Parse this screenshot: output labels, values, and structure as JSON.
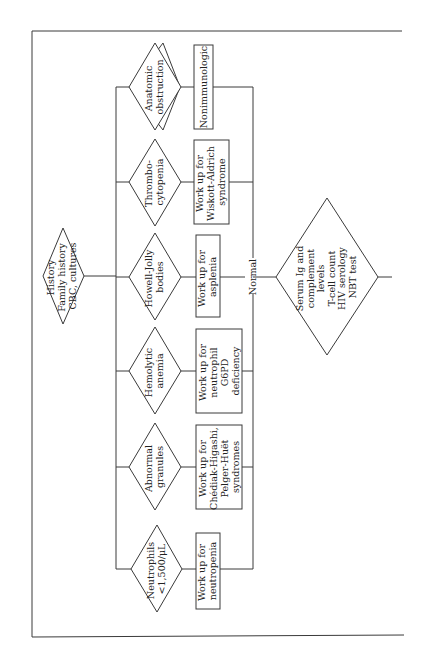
{
  "diagram": {
    "orientation": "rotated-90-ccw",
    "colors": {
      "line": "#3a3a3a",
      "text": "#222222",
      "background": "#ffffff"
    },
    "start_node": {
      "lines": [
        "History",
        "Family history",
        "CBC, cultures"
      ]
    },
    "branches": [
      {
        "condition": [
          "Anatomic",
          "obstruction"
        ],
        "action": [
          "Nonimmunologic"
        ]
      },
      {
        "condition": [
          "Thrombo-",
          "cytopenia"
        ],
        "action": [
          "Work up for",
          "Wiskott-Aldrich",
          "syndrome"
        ]
      },
      {
        "condition": [
          "Howell-Jolly",
          "bodies"
        ],
        "action": [
          "Work up for",
          "asplenia"
        ]
      },
      {
        "condition": [
          "Hemolytic",
          "anemia"
        ],
        "action": [
          "Work up for",
          "neutrophil",
          "G6PD",
          "deficiency"
        ]
      },
      {
        "condition": [
          "Abnormal",
          "granules"
        ],
        "action": [
          "Work up for",
          "Chédiak-Higashi,",
          "Pelger-Huët",
          "syndromes"
        ]
      },
      {
        "condition": [
          "Neutrophils",
          "<1,500/μL"
        ],
        "action": [
          "Work up for",
          "neutropenia"
        ]
      }
    ],
    "merge_label": "Normal",
    "end_node": {
      "lines": [
        "Serum Ig and",
        "complement",
        "levels",
        "T-cell count",
        "HIV serology",
        "NBT test"
      ]
    }
  }
}
